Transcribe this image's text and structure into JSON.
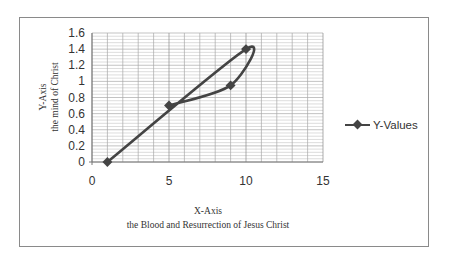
{
  "chart_data": {
    "type": "scatter",
    "subtype": "scatter with smoothed lines and markers",
    "title": "",
    "xlabel": "X-Axis",
    "xlabel_sub": "the Blood and Resurrection of Jesus Christ",
    "ylabel": "Y-Axis",
    "ylabel_sub": "the mind of Christ",
    "xlim": [
      0,
      15
    ],
    "ylim": [
      0,
      1.6
    ],
    "x_ticks": [
      "0",
      "5",
      "10",
      "15"
    ],
    "y_ticks": [
      "0",
      "0.2",
      "0.4",
      "0.6",
      "0.8",
      "1",
      "1.2",
      "1.4",
      "1.6"
    ],
    "grid": true,
    "legend_position": "right",
    "series": [
      {
        "name": "Y-Values",
        "color": "#444444",
        "points": [
          {
            "x": 1,
            "y": 0
          },
          {
            "x": 10,
            "y": 1.4
          },
          {
            "x": 9,
            "y": 0.95
          },
          {
            "x": 5,
            "y": 0.7
          }
        ]
      }
    ]
  },
  "legend": {
    "label": "Y-Values"
  }
}
